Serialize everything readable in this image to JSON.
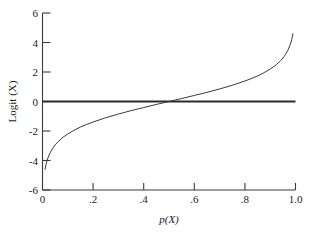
{
  "chart_data": {
    "type": "line",
    "title": "",
    "xlabel": "p(X)",
    "ylabel": "Logit (X)",
    "xlim": [
      0.0,
      1.0
    ],
    "ylim": [
      -6,
      6
    ],
    "grid": false,
    "legend": null,
    "xticks": [
      "0",
      ".2",
      ".4",
      ".6",
      ".8",
      "1.0"
    ],
    "xtick_values": [
      0.0,
      0.2,
      0.4,
      0.6,
      0.8,
      1.0
    ],
    "yticks": [
      "6",
      "4",
      "2",
      "0",
      "-2",
      "-4",
      "-6"
    ],
    "ytick_values": [
      6,
      4,
      2,
      0,
      -2,
      -4,
      -6
    ],
    "series": [
      {
        "name": "Logit curve",
        "description": "logit(p) = ln(p/(1-p))",
        "x": [
          0.01,
          0.015,
          0.02,
          0.03,
          0.04,
          0.05,
          0.06,
          0.08,
          0.1,
          0.125,
          0.15,
          0.175,
          0.2,
          0.25,
          0.3,
          0.35,
          0.4,
          0.45,
          0.5,
          0.55,
          0.6,
          0.65,
          0.7,
          0.75,
          0.8,
          0.825,
          0.85,
          0.875,
          0.9,
          0.92,
          0.94,
          0.95,
          0.96,
          0.97,
          0.98,
          0.985,
          0.99
        ],
        "y": [
          -4.6,
          -4.19,
          -3.89,
          -3.48,
          -3.18,
          -2.94,
          -2.75,
          -2.44,
          -2.2,
          -1.95,
          -1.73,
          -1.55,
          -1.39,
          -1.1,
          -0.85,
          -0.62,
          -0.41,
          -0.2,
          0.0,
          0.2,
          0.41,
          0.62,
          0.85,
          1.1,
          1.39,
          1.55,
          1.73,
          1.95,
          2.2,
          2.44,
          2.75,
          2.94,
          3.18,
          3.48,
          3.89,
          4.19,
          4.6
        ]
      },
      {
        "name": "Zero reference line",
        "description": "Horizontal line at Logit (X) = 0",
        "x": [
          0.0,
          1.0
        ],
        "y": [
          0,
          0
        ]
      }
    ]
  },
  "figure": {
    "background_color": "#ffffff",
    "axis_color": "#3a3a3a",
    "curve_color": "#3a3a3a",
    "zero_line_color": "#2a2a2a"
  }
}
